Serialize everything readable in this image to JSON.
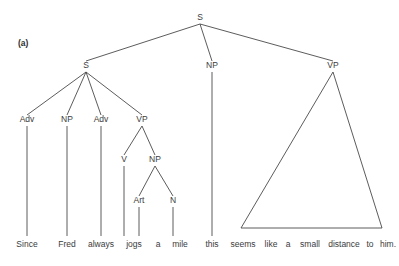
{
  "figure": {
    "panel_label": "(a)",
    "panel_label_x": 18,
    "panel_label_y": 46,
    "width": 399,
    "height": 266,
    "line_color": "#4a4a4a",
    "text_color": "#3b3b3b",
    "background_color": "#ffffff"
  },
  "nodes": [
    {
      "id": "S-root",
      "label": "S",
      "x": 200,
      "y": 20
    },
    {
      "id": "S-sub",
      "label": "S",
      "x": 86,
      "y": 68
    },
    {
      "id": "NP-subj",
      "label": "NP",
      "x": 212,
      "y": 68
    },
    {
      "id": "VP-main",
      "label": "VP",
      "x": 333,
      "y": 68
    },
    {
      "id": "Adv-1",
      "label": "Adv",
      "x": 27,
      "y": 122
    },
    {
      "id": "NP-fred",
      "label": "NP",
      "x": 67,
      "y": 122
    },
    {
      "id": "Adv-2",
      "label": "Adv",
      "x": 101,
      "y": 122
    },
    {
      "id": "VP-sub",
      "label": "VP",
      "x": 142,
      "y": 122
    },
    {
      "id": "V-jogs",
      "label": "V",
      "x": 124,
      "y": 162
    },
    {
      "id": "NP-mile",
      "label": "NP",
      "x": 155,
      "y": 162
    },
    {
      "id": "Art-a",
      "label": "Art",
      "x": 139,
      "y": 203
    },
    {
      "id": "N-mile",
      "label": "N",
      "x": 173,
      "y": 203
    }
  ],
  "edges": [
    {
      "id": "root-to-Ssub",
      "x1": 200,
      "y1": 24,
      "x2": 86,
      "y2": 61
    },
    {
      "id": "root-to-NP",
      "x1": 200,
      "y1": 24,
      "x2": 212,
      "y2": 61
    },
    {
      "id": "root-to-VP",
      "x1": 200,
      "y1": 24,
      "x2": 333,
      "y2": 61
    },
    {
      "id": "Ssub-to-Adv1",
      "x1": 86,
      "y1": 72,
      "x2": 27,
      "y2": 115
    },
    {
      "id": "Ssub-to-NP",
      "x1": 86,
      "y1": 72,
      "x2": 67,
      "y2": 115
    },
    {
      "id": "Ssub-to-Adv2",
      "x1": 86,
      "y1": 72,
      "x2": 101,
      "y2": 115
    },
    {
      "id": "Ssub-to-VP",
      "x1": 86,
      "y1": 72,
      "x2": 142,
      "y2": 115
    },
    {
      "id": "VPsub-to-V",
      "x1": 142,
      "y1": 126,
      "x2": 124,
      "y2": 155
    },
    {
      "id": "VPsub-to-NP",
      "x1": 142,
      "y1": 126,
      "x2": 155,
      "y2": 155
    },
    {
      "id": "NPmile-to-Art",
      "x1": 155,
      "y1": 166,
      "x2": 139,
      "y2": 196
    },
    {
      "id": "NPmile-to-N",
      "x1": 155,
      "y1": 166,
      "x2": 173,
      "y2": 196
    },
    {
      "id": "Adv1-to-since",
      "x1": 27,
      "y1": 126,
      "x2": 27,
      "y2": 236
    },
    {
      "id": "NPfred-to-fred",
      "x1": 67,
      "y1": 126,
      "x2": 67,
      "y2": 236
    },
    {
      "id": "Adv2-to-always",
      "x1": 101,
      "y1": 126,
      "x2": 101,
      "y2": 236
    },
    {
      "id": "V-to-jogs",
      "x1": 124,
      "y1": 166,
      "x2": 124,
      "y2": 236
    },
    {
      "id": "Art-to-a",
      "x1": 139,
      "y1": 207,
      "x2": 139,
      "y2": 236
    },
    {
      "id": "N-to-mile",
      "x1": 173,
      "y1": 207,
      "x2": 173,
      "y2": 236
    },
    {
      "id": "NPsubj-to-this",
      "x1": 212,
      "y1": 72,
      "x2": 212,
      "y2": 236
    },
    {
      "id": "VPmain-left",
      "x1": 333,
      "y1": 72,
      "x2": 241,
      "y2": 228
    },
    {
      "id": "VPmain-right",
      "x1": 333,
      "y1": 72,
      "x2": 382,
      "y2": 228
    },
    {
      "id": "VPmain-base",
      "x1": 241,
      "y1": 228,
      "x2": 382,
      "y2": 228
    }
  ],
  "words": [
    {
      "id": "word-since",
      "text": "Since",
      "x": 27,
      "y": 247
    },
    {
      "id": "word-fred",
      "text": "Fred",
      "x": 67,
      "y": 247
    },
    {
      "id": "word-always",
      "text": "always",
      "x": 101,
      "y": 247
    },
    {
      "id": "word-jogs",
      "text": "jogs",
      "x": 134,
      "y": 247
    },
    {
      "id": "word-a",
      "text": "a",
      "x": 158,
      "y": 247
    },
    {
      "id": "word-mile",
      "text": "mile",
      "x": 180,
      "y": 247
    },
    {
      "id": "word-this",
      "text": "this",
      "x": 212,
      "y": 247
    },
    {
      "id": "word-seems",
      "text": "seems",
      "x": 243,
      "y": 247
    },
    {
      "id": "word-like",
      "text": "like",
      "x": 271,
      "y": 247
    },
    {
      "id": "word-a2",
      "text": "a",
      "x": 288,
      "y": 247
    },
    {
      "id": "word-small",
      "text": "small",
      "x": 310,
      "y": 247
    },
    {
      "id": "word-distance",
      "text": "distance",
      "x": 344,
      "y": 247
    },
    {
      "id": "word-to",
      "text": "to",
      "x": 370,
      "y": 247
    },
    {
      "id": "word-him",
      "text": "him.",
      "x": 388,
      "y": 247
    }
  ],
  "sentence": "Since Fred always jogs a mile this seems like a small distance to him."
}
